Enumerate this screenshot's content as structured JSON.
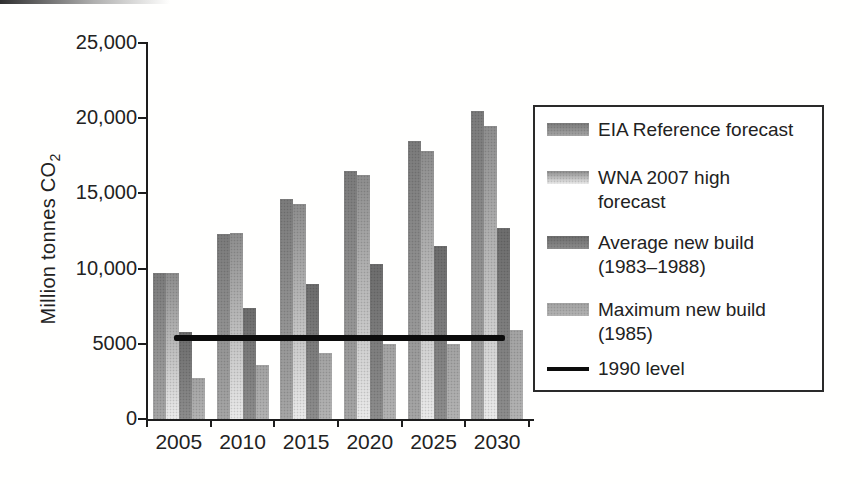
{
  "colors": {
    "axis": "#1d1d1d",
    "text": "#222222",
    "background": "#ffffff",
    "legend_border": "#2a2a2a"
  },
  "chart_data": {
    "type": "bar",
    "title": "",
    "xlabel": "",
    "ylabel": "Million tonnes CO2",
    "ylabel_display": {
      "text": "Million tonnes CO",
      "subscript": "2"
    },
    "ylim": [
      0,
      25000
    ],
    "grid": false,
    "legend_position": "right",
    "y_ticks": {
      "values": [
        0,
        5000,
        10000,
        15000,
        20000,
        25000
      ],
      "labels": [
        "0",
        "5000",
        "10,000",
        "15,000",
        "20,000",
        "25,000"
      ]
    },
    "categories": [
      "2005",
      "2010",
      "2015",
      "2020",
      "2025",
      "2030"
    ],
    "series": [
      {
        "name": "EIA Reference forecast",
        "values": [
          9700,
          12300,
          14600,
          16500,
          18500,
          20500
        ],
        "color_top": "#7b7b7b",
        "color_bottom": "#a6a6a6"
      },
      {
        "name": "WNA 2007 high forecast",
        "values": [
          9700,
          12400,
          14300,
          16200,
          17800,
          19500
        ],
        "color_top": "#8d8d8d",
        "color_bottom": "#ebebeb"
      },
      {
        "name": "Average new build (1983–1988)",
        "values": [
          5800,
          7400,
          9000,
          10300,
          11500,
          12700
        ],
        "color_top": "#6d6d6d",
        "color_bottom": "#8d8d8d"
      },
      {
        "name": "Maximum new build (1985)",
        "values": [
          2700,
          3600,
          4400,
          5000,
          5000,
          5900
        ],
        "color_top": "#a3a3a3",
        "color_bottom": "#b3b3b3"
      }
    ],
    "reference_line": {
      "name": "1990 level",
      "value": 5400,
      "color": "#0c0c0c"
    }
  },
  "legend": {
    "items": [
      {
        "label": "EIA Reference forecast"
      },
      {
        "label": "WNA 2007 high\nforecast"
      },
      {
        "label": "Average new build\n(1983–1988)"
      },
      {
        "label": "Maximum new build\n(1985)"
      },
      {
        "label": "1990 level"
      }
    ]
  }
}
